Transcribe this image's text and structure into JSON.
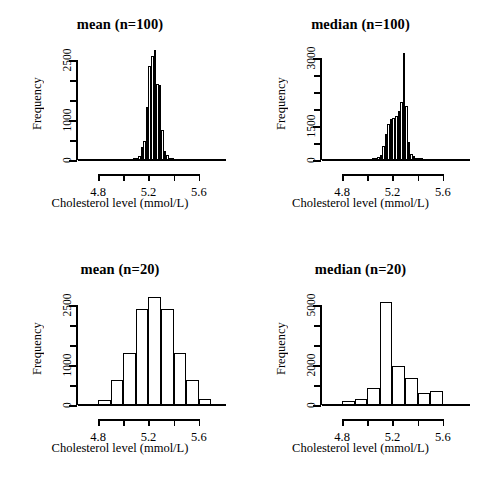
{
  "figure": {
    "background": "#ffffff",
    "ink": "#000000",
    "layout": "2x2 grid of histograms"
  },
  "panels": [
    {
      "id": "mean-n100",
      "title": "mean (n=100)",
      "ylabel": "Frequency",
      "xlabel": "Cholesterol level (mmol/L)"
    },
    {
      "id": "median-n100",
      "title": "median (n=100)",
      "ylabel": "Frequency",
      "xlabel": "Cholesterol level (mmol/L)"
    },
    {
      "id": "mean-n20",
      "title": "mean (n=20)",
      "ylabel": "Frequency",
      "xlabel": "Cholesterol level (mmol/L)"
    },
    {
      "id": "median-n20",
      "title": "median (n=20)",
      "ylabel": "Frequency",
      "xlabel": "Cholesterol level (mmol/L)"
    }
  ],
  "chart_data": [
    {
      "type": "bar",
      "subtype": "histogram",
      "id": "mean-n100",
      "title": "mean (n=100)",
      "xlabel": "Cholesterol level (mmol/L)",
      "ylabel": "Frequency",
      "xlim": [
        4.72,
        5.72
      ],
      "ylim": [
        0,
        2800
      ],
      "xticks": [
        4.8,
        5.0,
        5.2,
        5.4,
        5.6
      ],
      "xticklabels": [
        "4.8",
        "",
        "5.2",
        "",
        "5.6"
      ],
      "yticks": [
        0,
        500,
        1000,
        1500,
        2000,
        2500
      ],
      "yticklabels": [
        "0",
        "",
        "1000",
        "",
        "",
        "2500"
      ],
      "grid": false,
      "legend": null,
      "bin_width": 0.02,
      "bin_edges": [
        5.08,
        5.1,
        5.12,
        5.14,
        5.16,
        5.18,
        5.2,
        5.22,
        5.24,
        5.26,
        5.28,
        5.3,
        5.32,
        5.34,
        5.36,
        5.38,
        5.4
      ],
      "values": [
        20,
        40,
        90,
        320,
        480,
        1320,
        2350,
        2600,
        2750,
        1900,
        1880,
        750,
        230,
        120,
        60,
        25
      ]
    },
    {
      "type": "bar",
      "subtype": "histogram",
      "id": "median-n100",
      "title": "median (n=100)",
      "xlabel": "Cholesterol level (mmol/L)",
      "ylabel": "Frequency",
      "xlim": [
        4.72,
        5.72
      ],
      "ylim": [
        0,
        3300
      ],
      "xticks": [
        4.8,
        5.0,
        5.2,
        5.4,
        5.6
      ],
      "xticklabels": [
        "4.8",
        "",
        "5.2",
        "",
        "5.6"
      ],
      "yticks": [
        0,
        500,
        1000,
        1500,
        2000,
        2500,
        3000
      ],
      "yticklabels": [
        "0",
        "",
        "1500",
        "",
        "",
        "",
        "3000"
      ],
      "grid": false,
      "legend": null,
      "bin_width": 0.02,
      "bin_edges": [
        5.04,
        5.06,
        5.08,
        5.1,
        5.12,
        5.14,
        5.16,
        5.18,
        5.2,
        5.22,
        5.24,
        5.26,
        5.28,
        5.3,
        5.32,
        5.34,
        5.36,
        5.38,
        5.4,
        5.44
      ],
      "values": [
        30,
        60,
        90,
        150,
        420,
        780,
        1050,
        1200,
        1250,
        1300,
        1450,
        1700,
        3150,
        1600,
        520,
        180,
        120,
        70,
        40
      ]
    },
    {
      "type": "bar",
      "subtype": "histogram",
      "id": "mean-n20",
      "title": "mean (n=20)",
      "xlabel": "Cholesterol level (mmol/L)",
      "ylabel": "Frequency",
      "xlim": [
        4.72,
        5.72
      ],
      "ylim": [
        0,
        2800
      ],
      "xticks": [
        4.8,
        5.0,
        5.2,
        5.4,
        5.6
      ],
      "xticklabels": [
        "4.8",
        "",
        "5.2",
        "",
        "5.6"
      ],
      "yticks": [
        0,
        500,
        1000,
        1500,
        2000,
        2500
      ],
      "yticklabels": [
        "0",
        "",
        "1000",
        "",
        "",
        "2500"
      ],
      "grid": false,
      "legend": null,
      "bin_width": 0.1,
      "bin_edges": [
        4.8,
        4.9,
        5.0,
        5.1,
        5.2,
        5.3,
        5.4,
        5.5,
        5.6,
        5.7
      ],
      "values": [
        120,
        620,
        1300,
        2400,
        2700,
        2400,
        1300,
        620,
        160
      ]
    },
    {
      "type": "bar",
      "subtype": "histogram",
      "id": "median-n20",
      "title": "median (n=20)",
      "xlabel": "Cholesterol level (mmol/L)",
      "ylabel": "Frequency",
      "xlim": [
        4.72,
        5.72
      ],
      "ylim": [
        0,
        5600
      ],
      "xticks": [
        4.8,
        5.0,
        5.2,
        5.4,
        5.6
      ],
      "xticklabels": [
        "4.8",
        "",
        "5.2",
        "",
        "5.6"
      ],
      "yticks": [
        0,
        1000,
        2000,
        3000,
        4000,
        5000
      ],
      "yticklabels": [
        "0",
        "",
        "2000",
        "",
        "",
        "5000"
      ],
      "grid": false,
      "legend": null,
      "bin_width": 0.1,
      "bin_edges": [
        4.8,
        4.9,
        5.0,
        5.1,
        5.2,
        5.3,
        5.4,
        5.5,
        5.6
      ],
      "values": [
        180,
        320,
        850,
        5150,
        1950,
        1350,
        600,
        680
      ]
    }
  ]
}
